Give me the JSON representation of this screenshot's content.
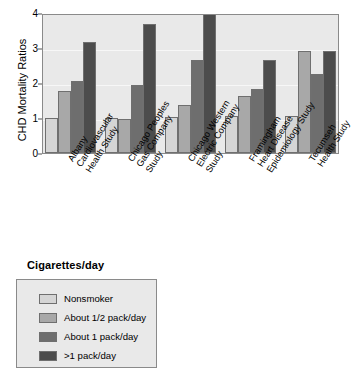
{
  "chart_data": {
    "type": "bar",
    "title": "",
    "xlabel": "",
    "ylabel": "CHD Mortality Ratios",
    "ylim": [
      0,
      4
    ],
    "yticks": [
      "0",
      "1",
      "2",
      "3",
      "4"
    ],
    "grid": true,
    "legend_position": "below-plot",
    "legend_title": "Cigarettes/day",
    "categories": [
      "Albany Cardiovascular Health Study",
      "Chicago Peoples Gas Company Study",
      "Chicago Western Electric Company Study",
      "Framingham Heart Disease Epidemiology Study",
      "Tecumseh Health Study"
    ],
    "category_lines": [
      [
        "Albany",
        "Cardiovascular",
        "Health Study"
      ],
      [
        "Chicago Peoples",
        "Gas Company",
        "Study"
      ],
      [
        "Chicago Western",
        "Electric Company",
        "Study"
      ],
      [
        "Framingham",
        "Heart Disease",
        "Epidemiology Study"
      ],
      [
        "Tecumseh",
        "Health Study"
      ]
    ],
    "series": [
      {
        "name": "Nonsmoker",
        "color": "#d5d5d5",
        "values": [
          1.0,
          1.01,
          1.02,
          1.05,
          1.06
        ]
      },
      {
        "name": "About 1/2 pack/day",
        "color": "#a8a8a8",
        "values": [
          1.78,
          0.97,
          1.38,
          1.63,
          2.92
        ]
      },
      {
        "name": "About 1 pack/day",
        "color": "#6e6e6e",
        "values": [
          2.07,
          1.95,
          2.65,
          1.82,
          2.25
        ]
      },
      {
        "name": ">1 pack/day",
        "color": "#4c4c4c",
        "values": [
          3.18,
          3.68,
          4.05,
          2.65,
          2.92
        ]
      }
    ]
  },
  "legend": {
    "title": "Cigarettes/day",
    "items": [
      {
        "label": "Nonsmoker",
        "color": "#d5d5d5"
      },
      {
        "label": "About 1/2 pack/day",
        "color": "#a8a8a8"
      },
      {
        "label": "About 1 pack/day",
        "color": "#6e6e6e"
      },
      {
        "label": ">1 pack/day",
        "color": "#4c4c4c"
      }
    ]
  }
}
